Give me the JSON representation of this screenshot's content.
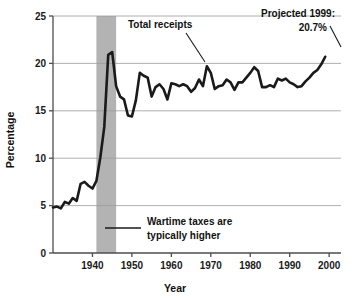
{
  "chart_data": {
    "type": "line",
    "title": "",
    "xlabel": "Year",
    "ylabel": "Percentage",
    "xlim": [
      1930,
      2003
    ],
    "ylim": [
      0,
      25
    ],
    "ytick_labels": [
      "0",
      "5",
      "10",
      "15",
      "20",
      "25"
    ],
    "yticks": [
      0,
      5,
      10,
      15,
      20,
      25
    ],
    "xtick_labels": [
      "1940",
      "1950",
      "1960",
      "1970",
      "1980",
      "1990",
      "2000"
    ],
    "xticks": [
      1940,
      1950,
      1960,
      1970,
      1980,
      1990,
      2000
    ],
    "grid": "horizontal",
    "legend": "none",
    "series": [
      {
        "name": "Total receipts",
        "x": [
          1930,
          1931,
          1932,
          1933,
          1934,
          1935,
          1936,
          1937,
          1938,
          1939,
          1940,
          1941,
          1942,
          1943,
          1944,
          1945,
          1946,
          1947,
          1948,
          1949,
          1950,
          1951,
          1952,
          1953,
          1954,
          1955,
          1956,
          1957,
          1958,
          1959,
          1960,
          1961,
          1962,
          1963,
          1964,
          1965,
          1966,
          1967,
          1968,
          1969,
          1970,
          1971,
          1972,
          1973,
          1974,
          1975,
          1976,
          1977,
          1978,
          1979,
          1980,
          1981,
          1982,
          1983,
          1984,
          1985,
          1986,
          1987,
          1988,
          1989,
          1990,
          1991,
          1992,
          1993,
          1994,
          1995,
          1996,
          1997,
          1998,
          1999
        ],
        "values": [
          4.8,
          4.9,
          4.7,
          5.4,
          5.2,
          5.8,
          5.5,
          7.3,
          7.5,
          7.1,
          6.8,
          7.6,
          10.1,
          13.3,
          20.9,
          21.2,
          17.6,
          16.5,
          16.2,
          14.5,
          14.4,
          16.1,
          19.0,
          18.7,
          18.5,
          16.5,
          17.5,
          17.8,
          17.3,
          16.2,
          17.9,
          17.8,
          17.6,
          17.8,
          17.6,
          17.0,
          17.4,
          18.3,
          17.6,
          19.7,
          19.0,
          17.3,
          17.6,
          17.7,
          18.3,
          18.0,
          17.2,
          18.0,
          18.0,
          18.5,
          19.0,
          19.6,
          19.2,
          17.5,
          17.5,
          17.7,
          17.5,
          18.4,
          18.2,
          18.4,
          18.0,
          17.8,
          17.5,
          17.6,
          18.1,
          18.5,
          19.0,
          19.3,
          19.9,
          20.7
        ],
        "color": "#1a1a1a"
      }
    ],
    "shaded_band": {
      "label": "Wartime",
      "x_start": 1941,
      "x_end": 1946,
      "color": "#b3b3b3"
    },
    "annotations": [
      {
        "name": "total-receipts",
        "text": "Total receipts",
        "lines": [
          "Total receipts"
        ]
      },
      {
        "name": "projected-1999",
        "text": "Projected 1999: 20.7%",
        "lines": [
          "Projected 1999:",
          "20.7%"
        ],
        "value": 20.7
      },
      {
        "name": "wartime-note",
        "text": "Wartime taxes are typically higher",
        "lines": [
          "Wartime taxes are",
          "typically higher"
        ]
      }
    ]
  },
  "axes": {
    "y_title": "Percentage",
    "x_title": "Year"
  },
  "ticks": {
    "y": [
      "25",
      "20",
      "15",
      "10",
      "5",
      "0"
    ],
    "x": [
      "1940",
      "1950",
      "1960",
      "1970",
      "1980",
      "1990",
      "2000"
    ]
  },
  "annotations": {
    "series_label": "Total receipts",
    "projected_line1": "Projected 1999:",
    "projected_line2": "20.7%",
    "wartime_line1": "Wartime taxes are",
    "wartime_line2": "typically higher"
  },
  "colors": {
    "line": "#1a1a1a",
    "band": "#b3b3b3",
    "grid": "#9a9a9a",
    "axis": "#4d4d4d",
    "text": "#111111",
    "background": "#ffffff"
  }
}
